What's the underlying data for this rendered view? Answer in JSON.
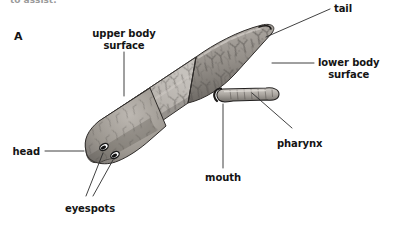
{
  "figure": {
    "panel_label": "A",
    "top_cropped_text": "to assist.",
    "background_color": "#ffffff",
    "ink_color": "#141414",
    "body_tone_light": "#c9c6c2",
    "body_tone_mid": "#9c9791",
    "body_tone_dark": "#6e6a66",
    "eyespot_color": "#1a1a1a"
  },
  "labels": {
    "tail": {
      "text": "tail",
      "align": "left"
    },
    "lower_body_surface": {
      "line1": "lower body",
      "line2": "surface",
      "align": "left"
    },
    "upper_body_surface": {
      "line1": "upper body",
      "line2": "surface",
      "align": "center"
    },
    "pharynx": {
      "text": "pharynx",
      "align": "left"
    },
    "mouth": {
      "text": "mouth",
      "align": "center"
    },
    "head": {
      "text": "head",
      "align": "right"
    },
    "eyespots": {
      "text": "eyespots",
      "align": "center"
    }
  },
  "leader_lines": [
    {
      "name": "tail-leader",
      "from": [
        330,
        9
      ],
      "to": [
        264,
        38
      ]
    },
    {
      "name": "lower-body-surface-leader",
      "from": [
        314,
        63
      ],
      "to": [
        272,
        63
      ]
    },
    {
      "name": "upper-body-surface-leader",
      "from": [
        124,
        52
      ],
      "to": [
        124,
        94
      ]
    },
    {
      "name": "pharynx-leader",
      "from": [
        292,
        128
      ],
      "to": [
        253,
        92
      ]
    },
    {
      "name": "mouth-leader",
      "from": [
        223,
        168
      ],
      "to": [
        223,
        103
      ]
    },
    {
      "name": "head-leader",
      "from": [
        45,
        151
      ],
      "to": [
        85,
        151
      ]
    },
    {
      "name": "eyespots-leader-1",
      "from": [
        86,
        196
      ],
      "to": [
        104,
        155
      ]
    },
    {
      "name": "eyespots-leader-2",
      "from": [
        92,
        196
      ],
      "to": [
        111,
        160
      ]
    }
  ]
}
